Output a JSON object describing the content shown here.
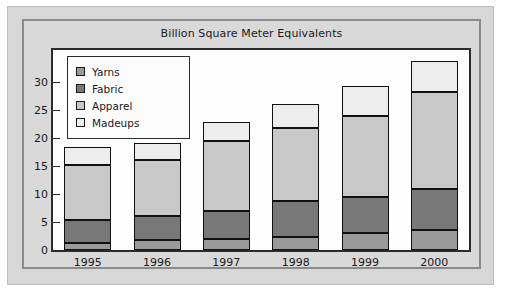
{
  "title": "Billion Square Meter Equivalents",
  "legend": {
    "items": [
      {
        "label": "Yarns",
        "color": "#9a9a9a"
      },
      {
        "label": "Fabric",
        "color": "#787878"
      },
      {
        "label": "Apparel",
        "color": "#c8c8c8"
      },
      {
        "label": "Madeups",
        "color": "#ededed"
      }
    ]
  },
  "axis": {
    "y_ticks": [
      "0",
      "5",
      "10",
      "15",
      "20",
      "25",
      "30"
    ],
    "x_ticks": [
      "1995",
      "1996",
      "1997",
      "1998",
      "1999",
      "2000"
    ]
  },
  "chart_data": {
    "type": "bar",
    "stacked": true,
    "title": "Billion Square Meter Equivalents",
    "xlabel": "",
    "ylabel": "",
    "ylim": [
      0,
      35
    ],
    "yticks": [
      0,
      5,
      10,
      15,
      20,
      25,
      30
    ],
    "grid": false,
    "legend_position": "top-left inside plot",
    "categories": [
      "1995",
      "1996",
      "1997",
      "1998",
      "1999",
      "2000"
    ],
    "series": [
      {
        "name": "Yarns",
        "color": "#9a9a9a",
        "values": [
          1.3,
          1.8,
          2.0,
          2.4,
          3.1,
          3.5
        ]
      },
      {
        "name": "Fabric",
        "color": "#787878",
        "values": [
          4.1,
          4.2,
          5.0,
          6.3,
          6.3,
          7.4
        ]
      },
      {
        "name": "Apparel",
        "color": "#c8c8c8",
        "values": [
          9.8,
          10.0,
          12.5,
          13.1,
          14.5,
          17.3
        ]
      },
      {
        "name": "Madeups",
        "color": "#ededed",
        "values": [
          3.2,
          3.2,
          3.3,
          4.3,
          5.4,
          5.5
        ]
      }
    ],
    "totals": [
      18.4,
      19.2,
      22.8,
      26.1,
      29.3,
      33.7
    ]
  }
}
